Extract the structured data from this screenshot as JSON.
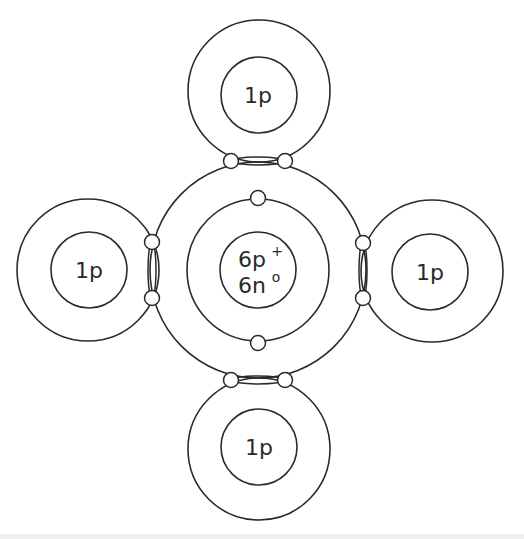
{
  "diagram": {
    "type": "bohr-model-methane",
    "colors": {
      "stroke": "#2a2a2a",
      "background": "#ffffff"
    },
    "carbon": {
      "nucleus_line1": "6p",
      "nucleus_line1_sup": "+",
      "nucleus_line2": "6n",
      "nucleus_line2_sup": "o"
    },
    "hydrogens": [
      {
        "position": "top",
        "label": "1p"
      },
      {
        "position": "left",
        "label": "1p"
      },
      {
        "position": "right",
        "label": "1p"
      },
      {
        "position": "bottom",
        "label": "1p"
      }
    ]
  }
}
